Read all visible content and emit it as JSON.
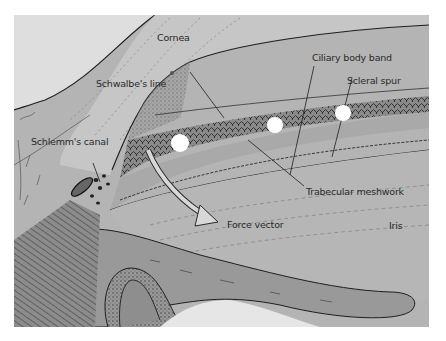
{
  "figure": {
    "type": "anatomical illustration",
    "colors": {
      "background": "#ffffff",
      "cornea": "#c6c6c6",
      "sclera": "#b4b4b4",
      "meshwork": "#8a8a8a",
      "iris": "#a8a8a8",
      "ciliary_body": "#8e8e8e",
      "laser_spot": "#ffffff",
      "arrow": "#d8d8d8",
      "ink": "#1e1e1e"
    },
    "labels": {
      "cornea": "Cornea",
      "schwalbes_line": "Schwalbe's line",
      "ciliary_body_band": "Ciliary body band",
      "scleral_spur": "Scleral spur",
      "schlemms_canal": "Schlemm's canal",
      "trabecular_meshwork": "Trabecular meshwork",
      "force_vector": "Force vector",
      "iris": "Iris"
    },
    "laser_spots": [
      {
        "cx": 166,
        "cy": 128,
        "r": 9
      },
      {
        "cx": 263,
        "cy": 110,
        "r": 9
      },
      {
        "cx": 334,
        "cy": 98,
        "r": 9
      }
    ]
  }
}
